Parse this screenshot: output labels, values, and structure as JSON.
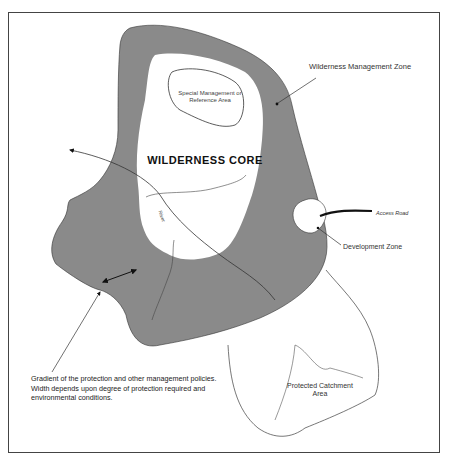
{
  "diagram": {
    "labels": {
      "wilderness_management_zone": "Wilderness Management Zone",
      "special_management_area": "Special Management or Reference Area",
      "wilderness_core": "WILDERNESS CORE",
      "access_road": "Access Road",
      "development_zone": "Development Zone",
      "river": "River",
      "gradient_note": "Gradient of the protection and other management policies. Width depends upon degree of protection required and environmental conditions.",
      "protected_catchment_area": "Protected Catchment Area"
    },
    "colors": {
      "management_zone_fill": "#8a8a8a",
      "core_fill": "#ffffff",
      "line": "#333333",
      "frame": "#444444"
    }
  }
}
